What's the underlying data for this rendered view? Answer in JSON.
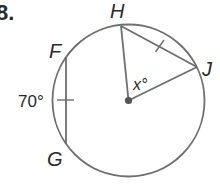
{
  "problem": {
    "number_label": "8.",
    "arc_measure_label": "70°",
    "unknown_angle_label": "x°"
  },
  "points": {
    "F": "F",
    "G": "G",
    "H": "H",
    "J": "J"
  },
  "colors": {
    "stroke": "#6e6e6e",
    "center_dot": "#555555",
    "text": "#2a2a2a"
  }
}
